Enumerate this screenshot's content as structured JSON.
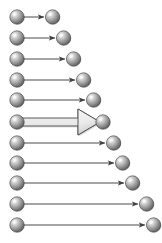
{
  "canvas": {
    "width": 162,
    "height": 243,
    "background": "#ffffff"
  },
  "style": {
    "sphere_radius": 7.2,
    "sphere_light": "#f2f2f2",
    "sphere_mid": "#a8a8a8",
    "sphere_dark": "#5b5b5b",
    "sphere_edge": "#3d3d3d",
    "thin_arrow_color": "#4a4a4a",
    "thin_arrow_width": 1,
    "block_arrow_fill": "#e8e8e8",
    "block_arrow_fill_dark": "#cfcfcf",
    "block_arrow_stroke": "#4a4a4a",
    "block_arrow_shaft_height": 8,
    "block_arrow_head_height": 26
  },
  "chart_data": {
    "type": "diagram",
    "title": "",
    "left_column_x": 17,
    "row_count": 11,
    "highlighted_row_index": 5,
    "rows": [
      {
        "index": 1,
        "y": 17,
        "start_x": 17,
        "end_x": 47,
        "arrow_kind": "thin",
        "label": "row-1"
      },
      {
        "index": 2,
        "y": 38,
        "start_x": 17,
        "end_x": 58,
        "arrow_kind": "thin",
        "label": "row-2"
      },
      {
        "index": 3,
        "y": 59,
        "start_x": 17,
        "end_x": 68,
        "arrow_kind": "thin",
        "label": "row-3"
      },
      {
        "index": 4,
        "y": 80,
        "start_x": 17,
        "end_x": 78,
        "arrow_kind": "thin",
        "label": "row-4"
      },
      {
        "index": 5,
        "y": 100,
        "start_x": 17,
        "end_x": 88,
        "arrow_kind": "thin",
        "label": "row-5"
      },
      {
        "index": 6,
        "y": 122,
        "start_x": 17,
        "end_x": 99,
        "arrow_kind": "block",
        "label": "row-6"
      },
      {
        "index": 7,
        "y": 143,
        "start_x": 17,
        "end_x": 108,
        "arrow_kind": "thin",
        "label": "row-7"
      },
      {
        "index": 8,
        "y": 163,
        "start_x": 17,
        "end_x": 117,
        "arrow_kind": "thin",
        "label": "row-8"
      },
      {
        "index": 9,
        "y": 183,
        "start_x": 17,
        "end_x": 127,
        "arrow_kind": "thin",
        "label": "row-9"
      },
      {
        "index": 10,
        "y": 204,
        "start_x": 17,
        "end_x": 141,
        "arrow_kind": "thin",
        "label": "row-10"
      },
      {
        "index": 11,
        "y": 225,
        "start_x": 17,
        "end_x": 148,
        "arrow_kind": "thin",
        "label": "row-11"
      }
    ]
  }
}
